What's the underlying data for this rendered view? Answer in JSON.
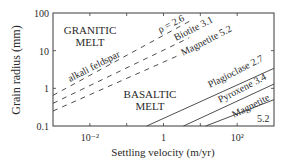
{
  "chart_data": {
    "type": "line",
    "title": "",
    "xlabel": "Settling velocity (m/yr)",
    "ylabel": "Grain radius (mm)",
    "xscale": "log",
    "yscale": "log",
    "xlim": [
      0.001,
      1000
    ],
    "ylim": [
      0.1,
      100
    ],
    "x_ticks": [
      0.001,
      0.01,
      0.1,
      1,
      10,
      100,
      1000
    ],
    "x_tick_labels": [
      {
        "value": 0.01,
        "label": "10⁻²"
      },
      {
        "value": 1,
        "label": "1"
      },
      {
        "value": 100,
        "label": "10²"
      }
    ],
    "y_tick_labels": [
      {
        "value": 100,
        "label": "100"
      },
      {
        "value": 10,
        "label": "10"
      },
      {
        "value": 1,
        "label": "1"
      },
      {
        "value": 0.1,
        "label": "0.1"
      }
    ],
    "grid": false,
    "regions": [
      {
        "name": "granitic-melt",
        "label_lines": [
          "GRANITIC",
          "MELT"
        ]
      },
      {
        "name": "basaltic-melt",
        "label_lines": [
          "BASALTIC",
          "MELT"
        ]
      }
    ],
    "series": [
      {
        "name": "alkali feldspar",
        "density": 2.6,
        "melt": "granitic",
        "style": "dashed",
        "label": "alkali feldspar",
        "density_label": "ρ = 2.6",
        "points": [
          [
            0.001,
            0.65
          ],
          [
            5,
            60
          ]
        ]
      },
      {
        "name": "Biotite",
        "density": 3.1,
        "melt": "granitic",
        "style": "dashed",
        "label": "Biotite 3.1",
        "points": [
          [
            0.001,
            0.4
          ],
          [
            5,
            22
          ]
        ]
      },
      {
        "name": "Magnetite",
        "density": 5.2,
        "melt": "granitic",
        "style": "dashed",
        "label": "Magnetite 5.2",
        "points": [
          [
            0.001,
            0.25
          ],
          [
            3,
            8
          ]
        ]
      },
      {
        "name": "Plagioclase",
        "density": 2.7,
        "melt": "basaltic",
        "style": "solid",
        "label": "Plagioclase 2.7",
        "points": [
          [
            0.35,
            0.1
          ],
          [
            1000,
            3.4
          ]
        ]
      },
      {
        "name": "Pyroxene",
        "density": 3.4,
        "melt": "basaltic",
        "style": "solid",
        "label": "Pyroxene 3.4",
        "points": [
          [
            3.5,
            0.1
          ],
          [
            1000,
            1.3
          ]
        ]
      },
      {
        "name": "Magnetite",
        "density": 5.2,
        "melt": "basaltic",
        "style": "solid",
        "label_lines": [
          "Magnetite",
          "5.2"
        ],
        "points": [
          [
            14,
            0.1
          ],
          [
            1000,
            0.5
          ]
        ]
      }
    ]
  }
}
